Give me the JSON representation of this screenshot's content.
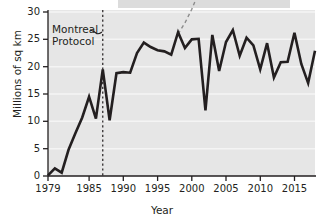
{
  "chart_data": {
    "type": "line",
    "title": "",
    "xlabel": "Year",
    "ylabel": "Millions of sq km",
    "xlim": [
      1979,
      2018
    ],
    "ylim": [
      0,
      30
    ],
    "xticks": [
      1979,
      1985,
      1990,
      1995,
      2000,
      2005,
      2010,
      2015
    ],
    "yticks": [
      0,
      5,
      10,
      15,
      20,
      25,
      30
    ],
    "grid": "horizontal-light",
    "legend": "none",
    "series": [
      {
        "name": "Antarctic ozone hole area",
        "style": "solid",
        "color": "#231f20",
        "x": [
          1979,
          1980,
          1981,
          1982,
          1983,
          1984,
          1985,
          1986,
          1987,
          1988,
          1989,
          1990,
          1991,
          1992,
          1993,
          1994,
          1995,
          1996,
          1997,
          1998,
          1999,
          2000,
          2001,
          2002,
          2003,
          2004,
          2005,
          2006,
          2007,
          2008,
          2009,
          2010,
          2011,
          2012,
          2013,
          2014,
          2015,
          2016,
          2017,
          2018
        ],
        "values": [
          0.1,
          1.4,
          0.6,
          4.8,
          7.8,
          10.7,
          14.5,
          10.5,
          19.5,
          10.2,
          18.8,
          19.0,
          18.9,
          22.5,
          24.4,
          23.6,
          23.0,
          22.8,
          22.2,
          26.3,
          23.4,
          25.0,
          25.1,
          12.0,
          25.8,
          19.2,
          24.5,
          26.7,
          22.0,
          25.3,
          23.9,
          19.5,
          24.3,
          18.0,
          20.8,
          20.9,
          26.2,
          20.5,
          17.0,
          22.9
        ]
      },
      {
        "name": "Projection without Montreal Protocol",
        "style": "dashed",
        "color": "#8c8c8c",
        "x": [
          1998,
          1999,
          2000,
          2001
        ],
        "values": [
          26.0,
          28.0,
          30.5,
          33.5
        ]
      }
    ],
    "annotations": [
      {
        "name": "montreal-protocol",
        "text_line1": "Montreal",
        "text_line2": "Protocol",
        "at_x": 1987,
        "kind": "vertical-dashed-line-with-label"
      }
    ]
  },
  "axes": {
    "ylabel": "Millions of sq km",
    "xlabel": "Year",
    "ytick_labels": [
      "0",
      "5",
      "10",
      "15",
      "20",
      "25",
      "30"
    ],
    "xtick_labels": [
      "1979",
      "1985",
      "1990",
      "1995",
      "2000",
      "2005",
      "2010",
      "2015"
    ]
  },
  "annotation": {
    "line1": "Montreal",
    "line2": "Protocol"
  },
  "colors": {
    "line": "#231f20",
    "projection": "#8c8c8c",
    "plot_background": "#e6e6e6",
    "caption_band": "#dcdcdc",
    "gridline": "#f2f2f2"
  }
}
